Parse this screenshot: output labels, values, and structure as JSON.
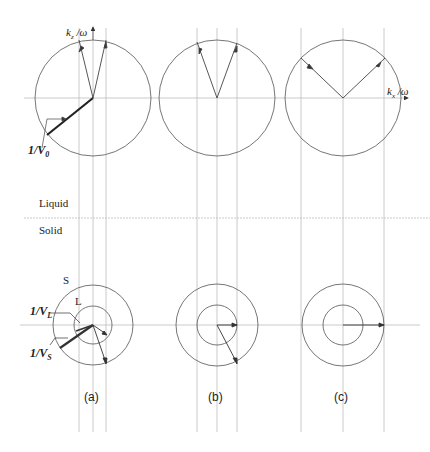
{
  "labels": {
    "kz_axis": "k",
    "kz_sub": "z",
    "kz_suffix": " /ω",
    "kx_axis": "k",
    "kx_sub": "x",
    "kx_suffix": " /ω",
    "v0": "1/V",
    "v0_sub": "0",
    "vl": "1/V",
    "vl_sub": "L",
    "vs": "1/V",
    "vs_sub": "S",
    "liquid": "Liquid",
    "solid": "Solid",
    "circle_s": "S",
    "circle_l": "L"
  },
  "panels": [
    {
      "id": "a",
      "caption": "(a)"
    },
    {
      "id": "b",
      "caption": "(b)"
    },
    {
      "id": "c",
      "caption": "(c)"
    }
  ],
  "colors": {
    "line": "#555555",
    "guide": "#b8b8b8",
    "text": "#222222"
  }
}
